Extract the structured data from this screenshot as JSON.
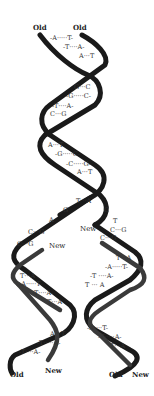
{
  "diagram": {
    "type": "dna-replication",
    "labels": {
      "top_left": "Old",
      "top_right": "Old",
      "new_left": "New",
      "new_right": "New",
      "bottom_left_old": "Old",
      "bottom_left_new": "New",
      "bottom_right_old": "Old",
      "bottom_right_new": "New"
    },
    "parent_pairs": [
      "-A·····T-",
      "-T····A-",
      "A···T",
      "G···C",
      "-G·····C-",
      "-T····A-",
      "C···G",
      "A···T",
      "-G·····C-",
      "-C·····G-",
      "A···T",
      "T···A"
    ],
    "fork_unpaired": {
      "left_bases": [
        "G",
        "A"
      ],
      "right_bases": [
        "C",
        "T"
      ]
    },
    "left_daughter_pairs": [
      "C···G",
      "C···G",
      "T···A",
      "-A·····T-",
      "-T····A-",
      "T···A",
      "A···T",
      "-T·····A-",
      "-T····A-"
    ],
    "right_daughter_pairs": [
      "C···G",
      "C···G",
      "T···A",
      "-A·····T-",
      "-T ····A-",
      "T ··· A",
      "-A····T-",
      "-T·····A-",
      "T···A"
    ],
    "colors": {
      "old_strand": "#1a1a1a",
      "new_strand": "#3a3a3a",
      "background": "#ffffff"
    }
  }
}
